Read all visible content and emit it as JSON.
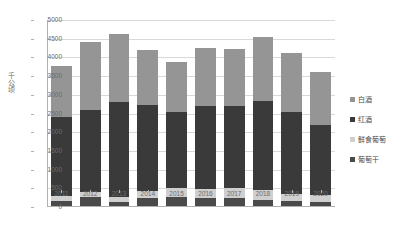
{
  "chart_data": {
    "type": "bar",
    "stacked": true,
    "title": "",
    "xlabel": "",
    "ylabel": "千公顷",
    "ylim": [
      0,
      5000
    ],
    "ytick_step": 500,
    "grid": true,
    "legend_position": "right",
    "categories": [
      "2011",
      "2012",
      "2013",
      "2014",
      "2015",
      "2016",
      "2017",
      "2018",
      "2019",
      "2020"
    ],
    "yticks": [
      "0",
      "500",
      "1000",
      "1500",
      "2000",
      "2500",
      "3000",
      "3500",
      "4000",
      "4500",
      "5000"
    ],
    "series": [
      {
        "name": "白酒",
        "color": "#959595",
        "values": [
          1380,
          1830,
          1810,
          1450,
          1350,
          1550,
          1520,
          1720,
          1580,
          1420
        ]
      },
      {
        "name": "红酒",
        "color": "#3a3a3a",
        "values": [
          2100,
          2180,
          2550,
          2300,
          2020,
          2210,
          2200,
          2370,
          2170,
          1880
        ]
      },
      {
        "name": "鲜食葡萄",
        "color": "#cfcfcf",
        "values": [
          130,
          150,
          130,
          190,
          230,
          240,
          250,
          260,
          210,
          180
        ]
      },
      {
        "name": "葡萄干",
        "color": "#4a4a4a",
        "values": [
          170,
          260,
          130,
          250,
          280,
          250,
          250,
          200,
          150,
          130
        ]
      }
    ],
    "totals": [
      3780,
      4420,
      4620,
      4190,
      3880,
      4250,
      4220,
      4550,
      4110,
      3610
    ]
  }
}
